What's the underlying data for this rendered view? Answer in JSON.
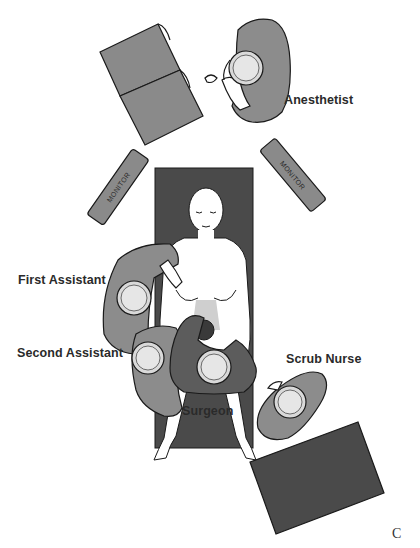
{
  "figure": {
    "panel_letter": "C",
    "colors": {
      "table": "#4a4a4a",
      "gown_light": "#8c8c8c",
      "gown_dark": "#5c5c5c",
      "equipment": "#8a8a8a",
      "head": "#d9d9d9",
      "outline": "#1a1a1a"
    }
  },
  "labels": {
    "anesthetist": "Anesthetist",
    "first_assistant": "First Assistant",
    "second_assistant": "Second Assistant",
    "surgeon": "Surgeon",
    "scrub_nurse": "Scrub Nurse"
  },
  "equipment": {
    "monitor_left": "MONITOR",
    "monitor_right": "MONITOR"
  }
}
